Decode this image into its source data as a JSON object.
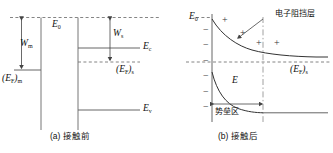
{
  "figure": {
    "title_a": "(a) 接触前",
    "title_b": "(b) 接触后",
    "panel_a": {
      "vacuum_level": "E",
      "vacuum_level_sub": "0",
      "metal_workfunction": "W",
      "metal_workfunction_sub": "m",
      "metal_fermi": "(E",
      "metal_fermi_sub": "F",
      "metal_fermi_tail": ")",
      "metal_fermi_tail_sub": "m",
      "semi_workfunction": "W",
      "semi_workfunction_sub": "s",
      "conduction_band": "E",
      "conduction_band_sub": "c",
      "semi_fermi": "(E",
      "semi_fermi_sub": "F",
      "semi_fermi_tail": ")",
      "semi_fermi_tail_sub": "s",
      "valence_band": "E",
      "valence_band_sub": "v"
    },
    "panel_b": {
      "vacuum_level": "E",
      "vacuum_level_sub": "0",
      "field_label": "E",
      "semi_fermi": "(E",
      "semi_fermi_sub": "F",
      "semi_fermi_tail": ")",
      "semi_fermi_tail_sub": "s",
      "blocking_layer": "电子阻挡层",
      "barrier_region": "势垒区",
      "negative_charges": [
        "−",
        "−",
        "−",
        "−",
        "−",
        "−"
      ],
      "positive_charges": [
        "+",
        "+",
        "+",
        "+"
      ]
    },
    "colors": {
      "line": "#555555",
      "dashed": "#777777",
      "text": "#111111",
      "curve": "#333333"
    }
  }
}
